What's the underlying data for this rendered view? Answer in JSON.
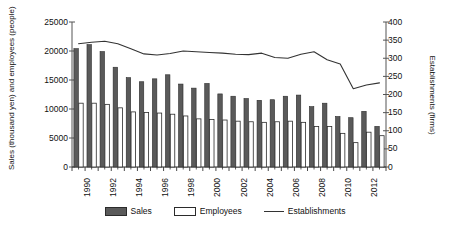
{
  "axes": {
    "y_left_title": "Sales (thousand yen) and employees (people)",
    "y_right_title": "Establishments (firms)",
    "y_left_ticks": [
      "25000",
      "20000",
      "15000",
      "10000",
      "5000",
      "0"
    ],
    "y_right_ticks": [
      "400",
      "350",
      "300",
      "250",
      "200",
      "150",
      "100",
      "50",
      "0"
    ],
    "x_ticks": [
      "1990",
      "1992",
      "1994",
      "1996",
      "1998",
      "2000",
      "2002",
      "2004",
      "2006",
      "2008",
      "2010",
      "2012"
    ]
  },
  "legend": {
    "items": [
      {
        "label": "Sales",
        "marker": "filled-bar-swatch"
      },
      {
        "label": "Employees",
        "marker": "hollow-bar-swatch"
      },
      {
        "label": "Establishments",
        "marker": "line-swatch"
      }
    ]
  },
  "colors": {
    "sales_bar": "#5a5a5a",
    "sales_bar_edge": "#2b2b2b",
    "employees_bar": "#ffffff",
    "employees_bar_edge": "#2b2b2b",
    "establishments_line": "#333333",
    "axis": "#555555",
    "background": "#ffffff"
  },
  "chart_data": {
    "type": "bar",
    "title": "",
    "xlabel": "",
    "ylabel": "Sales (thousand yen) and employees (people)",
    "y2label": "Establishments (firms)",
    "ylim": [
      0,
      25000
    ],
    "y2lim": [
      0,
      400
    ],
    "grid": false,
    "legend_position": "bottom",
    "categories": [
      "1990",
      "1991",
      "1992",
      "1993",
      "1994",
      "1995",
      "1996",
      "1997",
      "1998",
      "1999",
      "2000",
      "2001",
      "2002",
      "2003",
      "2004",
      "2005",
      "2006",
      "2007",
      "2008",
      "2009",
      "2010",
      "2011",
      "2012",
      "2013"
    ],
    "series": [
      {
        "name": "Sales",
        "axis": "left",
        "type": "bar",
        "values": [
          20400,
          21100,
          19900,
          17200,
          15400,
          14700,
          15200,
          15900,
          14300,
          13600,
          14400,
          12600,
          12200,
          11800,
          11500,
          11600,
          12200,
          12400,
          10400,
          11000,
          8700,
          8500,
          9600,
          7000
        ]
      },
      {
        "name": "Employees",
        "axis": "left",
        "type": "bar",
        "values": [
          11000,
          11000,
          10800,
          10200,
          9500,
          9400,
          9300,
          9100,
          8800,
          8300,
          8200,
          8100,
          7900,
          7800,
          7700,
          7800,
          7900,
          7700,
          7000,
          7000,
          5800,
          4200,
          6000,
          5400
        ]
      },
      {
        "name": "Establishments",
        "axis": "right",
        "type": "line",
        "values": [
          340,
          344,
          347,
          340,
          326,
          312,
          309,
          313,
          320,
          318,
          316,
          314,
          311,
          310,
          314,
          302,
          300,
          311,
          318,
          296,
          284,
          216,
          226,
          232
        ]
      }
    ]
  }
}
